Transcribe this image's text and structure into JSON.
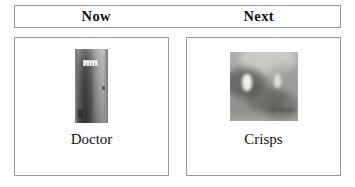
{
  "board": {
    "header": {
      "columns": [
        {
          "label": "Now"
        },
        {
          "label": "Next"
        }
      ]
    },
    "cards": [
      {
        "slot": "now",
        "label": "Doctor",
        "image": {
          "name": "door-photo",
          "subject": "grayscale photograph of a closed door with a white sign plaque and a handle"
        }
      },
      {
        "slot": "next",
        "label": "Crisps",
        "image": {
          "name": "crisps-photo",
          "subject": "blurry grayscale photograph of packets of crisps"
        }
      }
    ]
  },
  "colors": {
    "page_background": "#ffffff",
    "border": "#9a9a9a",
    "text": "#111111"
  }
}
